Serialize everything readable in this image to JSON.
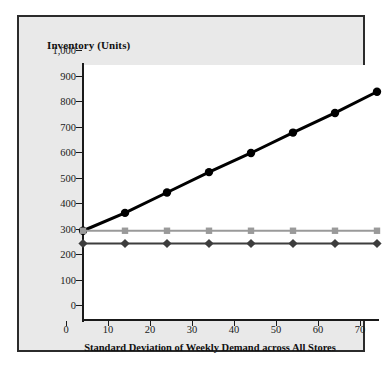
{
  "chart_data": {
    "type": "line",
    "title": "",
    "xlabel": "Standard Deviation of Weekly Demand across All Stores",
    "ylabel": "Inventory (Units)",
    "x": [
      0,
      10,
      20,
      30,
      40,
      50,
      60,
      70
    ],
    "xlim": [
      0,
      70
    ],
    "ylim": [
      0,
      1000
    ],
    "xticks": [
      "0",
      "10",
      "20",
      "30",
      "40",
      "50",
      "60",
      "70"
    ],
    "yticks": [
      "0",
      "100",
      "200",
      "300",
      "400",
      "500",
      "600",
      "700",
      "800",
      "900",
      "1,000"
    ],
    "ytick_values": [
      0,
      100,
      200,
      300,
      400,
      500,
      600,
      700,
      800,
      900,
      1000
    ],
    "grid": false,
    "legend": "none",
    "series": [
      {
        "name": "decentralized-inventory",
        "marker": "circle",
        "color": "#000000",
        "values": [
          350,
          420,
          500,
          580,
          655,
          735,
          812,
          895
        ]
      },
      {
        "name": "partially-centralized-inventory",
        "marker": "square",
        "color": "#9a9a9a",
        "values": [
          350,
          350,
          350,
          350,
          350,
          350,
          350,
          350
        ]
      },
      {
        "name": "centralized-inventory",
        "marker": "diamond",
        "color": "#3d3d3d",
        "values": [
          300,
          300,
          300,
          300,
          300,
          300,
          300,
          300
        ]
      }
    ]
  },
  "figure": {
    "panel_background": "#e9e9e9",
    "plot_background": "#ffffff",
    "border_color": "#2b2b2b",
    "axis_color": "#1a1a1a"
  }
}
